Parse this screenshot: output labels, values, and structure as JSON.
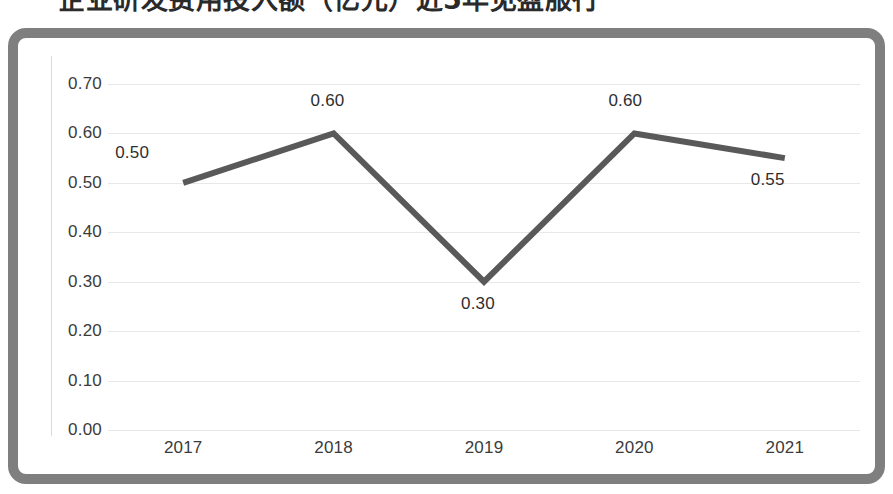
{
  "page": {
    "title_fragment": "企业研发费用投入额（亿元）近5年见盈服行"
  },
  "chart_data": {
    "type": "line",
    "title": "",
    "xlabel": "",
    "ylabel": "",
    "categories": [
      "2017",
      "2018",
      "2019",
      "2020",
      "2021"
    ],
    "values": [
      0.5,
      0.6,
      0.3,
      0.6,
      0.55
    ],
    "data_labels": [
      "0.50",
      "0.60",
      "0.30",
      "0.60",
      "0.55"
    ],
    "ylim": [
      0.0,
      0.7
    ],
    "ytick_labels": [
      "0.70",
      "0.60",
      "0.50",
      "0.40",
      "0.30",
      "0.20",
      "0.10",
      "0.00"
    ],
    "ytick_values": [
      0.7,
      0.6,
      0.5,
      0.4,
      0.3,
      0.2,
      0.1,
      0.0
    ],
    "grid": true,
    "legend": "none",
    "series": [
      {
        "name": "series-1",
        "values": [
          0.5,
          0.6,
          0.3,
          0.6,
          0.55
        ]
      }
    ],
    "colors": {
      "line": "#595959",
      "gridline": "#e8e8e8",
      "frame_border": "#7f7f7f",
      "tick_text": "#3b3b3b",
      "label_text": "#2e2e2e",
      "plot_background": "#ffffff"
    },
    "line_width_px": 6
  }
}
